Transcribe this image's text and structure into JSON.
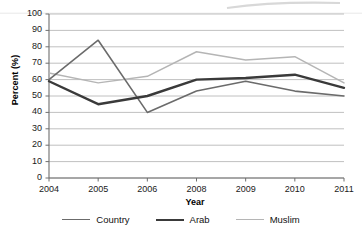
{
  "chart_data": {
    "type": "line",
    "title": "",
    "xlabel": "Year",
    "ylabel": "Percent (%)",
    "categories": [
      "2004",
      "2005",
      "2006",
      "2008",
      "2009",
      "2010",
      "2011"
    ],
    "ylim": [
      0,
      100
    ],
    "ytick_step": 10,
    "yticks": [
      "100",
      "90",
      "80",
      "70",
      "60",
      "50",
      "40",
      "30",
      "20",
      "10",
      "0"
    ],
    "grid": "horizontal",
    "legend_position": "bottom",
    "series": [
      {
        "name": "Country",
        "color": "#6b6b6b",
        "width": 1.6,
        "values": [
          60,
          84,
          40,
          53,
          59,
          53,
          50
        ]
      },
      {
        "name": "Arab",
        "color": "#3a3a3a",
        "width": 2.4,
        "values": [
          59,
          45,
          50,
          60,
          61,
          63,
          55
        ]
      },
      {
        "name": "Muslim",
        "color": "#b5b5b5",
        "width": 1.5,
        "values": [
          64,
          58,
          62,
          77,
          72,
          74,
          58
        ]
      }
    ]
  },
  "axes": {
    "axis_color": "#6e6e6e",
    "grid_color": "#b0b0b0",
    "plot_left": 49,
    "plot_right": 344,
    "plot_top": 14,
    "plot_bottom": 178
  }
}
